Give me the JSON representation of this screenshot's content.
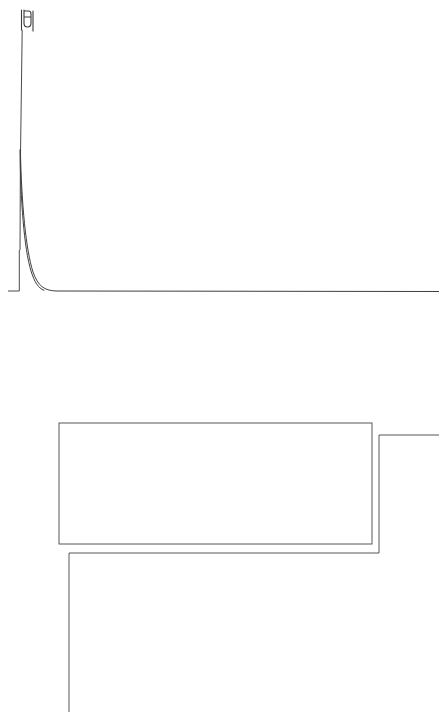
{
  "document": {
    "title": "Line Drawing",
    "background_color": "#ffffff",
    "width": 439,
    "height": 712
  },
  "style": {
    "line_color": "#4a4a4a",
    "curve_color": "#3e3e3e",
    "box_color": "#575757",
    "hook_color": "#3a3a3a",
    "line_width": 1
  },
  "figure": {
    "type": "line-drawing",
    "elements": [
      {
        "name": "hook-glyph",
        "kind": "path",
        "path": "M21.5 10 L21.5 30 M24 10 L24 23 Q24 27 27.5 27 Q31 27 31 23 L31 14 Q31 11 28.5 11 L24.5 11 M24 17 L30.5 17 M33 11 L33 31"
      },
      {
        "name": "vertical-stem",
        "kind": "path",
        "path": "M22.2 30 L20.4 162 L20.0 250"
      },
      {
        "name": "decay-curve",
        "kind": "path",
        "path": "M20.4 150 C21.5 205, 26 250, 33 272 C38 286, 44 290.5, 56 291 L439 291.5"
      },
      {
        "name": "decay-curve-inner",
        "kind": "path",
        "path": "M20.0 150 C20.6 200, 24 248, 31 271 C34.5 282, 38 288, 44 290.3"
      },
      {
        "name": "baseline-stub",
        "kind": "path",
        "path": "M19.3 250 L19.3 291 L8 291"
      },
      {
        "name": "inner-rectangle",
        "kind": "rect",
        "x": 59,
        "y": 423,
        "width": 313,
        "height": 121
      },
      {
        "name": "stepped-bracket",
        "kind": "path",
        "path": "M439 435 L379 435 L379 553 L69 553 L69 712"
      }
    ]
  }
}
